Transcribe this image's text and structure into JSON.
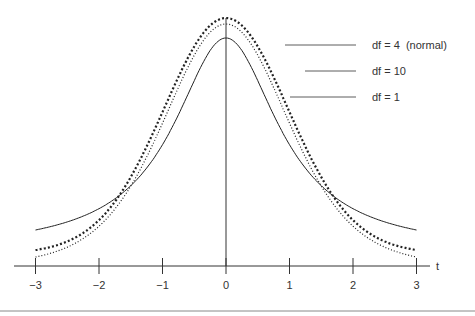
{
  "chart_data": {
    "type": "line",
    "title": "",
    "xlabel": "t",
    "ylabel": "",
    "xlim": [
      -3,
      3
    ],
    "x_ticks": [
      "-3",
      "-2",
      "-1",
      "0",
      "1",
      "2",
      "3"
    ],
    "grid": false,
    "legend_position": "right (leader-line labels)",
    "series": [
      {
        "name": "df = 4  (normal)",
        "style": "dashed-heavy",
        "peak_y_px": 18
      },
      {
        "name": "df = 10",
        "style": "dotted",
        "peak_y_px": 24
      },
      {
        "name": "df = 1",
        "style": "solid",
        "peak_y_px": 38
      }
    ]
  },
  "labels": {
    "s0": "df = 4  (normal)",
    "s1": "df = 10",
    "s2": "df = 1",
    "axis_t": "t",
    "ticks": [
      "−3",
      "−2",
      "−1",
      "0",
      "1",
      "2",
      "3"
    ]
  },
  "colors": {
    "ink": "#222222",
    "rule": "#888888"
  }
}
